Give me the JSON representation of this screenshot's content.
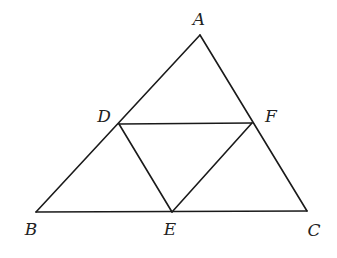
{
  "diagram": {
    "type": "geometry",
    "stroke_color": "#1a1a1a",
    "background": "#ffffff",
    "points": {
      "A": {
        "x": 200,
        "y": 35
      },
      "B": {
        "x": 36,
        "y": 212
      },
      "C": {
        "x": 307,
        "y": 211
      },
      "D": {
        "x": 119,
        "y": 124
      },
      "E": {
        "x": 172,
        "y": 212
      },
      "F": {
        "x": 252,
        "y": 123
      }
    },
    "segments": [
      [
        "A",
        "B"
      ],
      [
        "B",
        "C"
      ],
      [
        "C",
        "A"
      ],
      [
        "D",
        "F"
      ],
      [
        "D",
        "E"
      ],
      [
        "E",
        "F"
      ]
    ],
    "labels": {
      "A": {
        "text": "A",
        "x": 199,
        "y": 25
      },
      "B": {
        "text": "B",
        "x": 31,
        "y": 235
      },
      "C": {
        "text": "C",
        "x": 314,
        "y": 236
      },
      "D": {
        "text": "D",
        "x": 104,
        "y": 122
      },
      "E": {
        "text": "E",
        "x": 170,
        "y": 235
      },
      "F": {
        "text": "F",
        "x": 271,
        "y": 122
      }
    }
  }
}
